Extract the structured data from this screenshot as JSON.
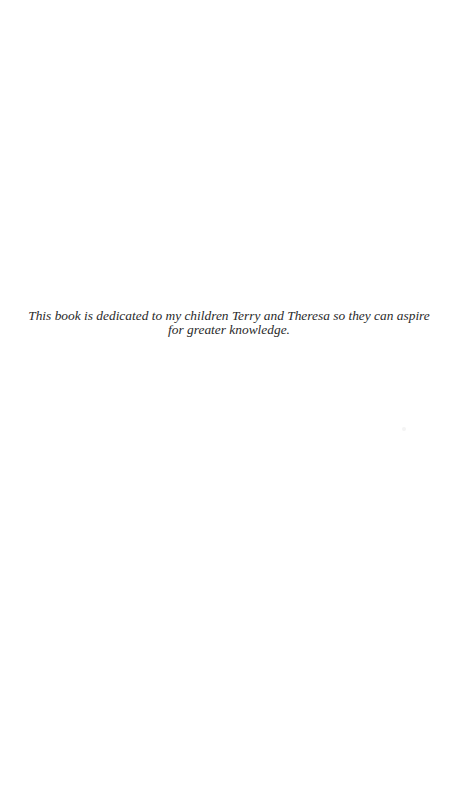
{
  "page": {
    "type": "dedication",
    "lines": [
      "This book is dedicated to my children Terry and Theresa so they can aspire",
      "for greater knowledge."
    ]
  },
  "colors": {
    "background": "#ffffff",
    "text": "#2a2a2a"
  }
}
